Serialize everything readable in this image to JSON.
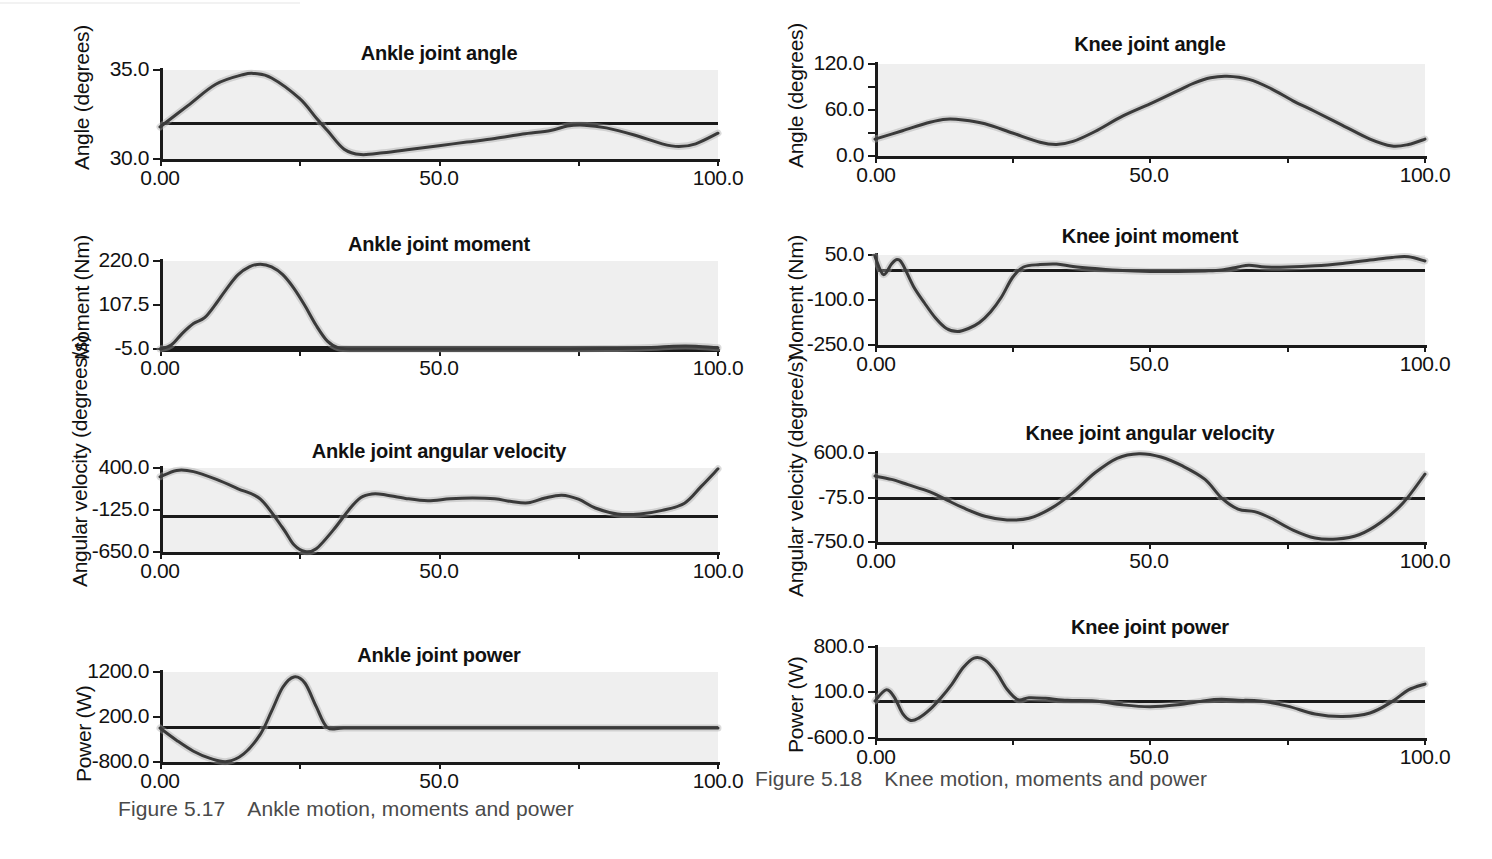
{
  "figures": [
    {
      "id": "ankle",
      "caption_number": "Figure 5.17",
      "caption_text": "Ankle motion, moments and power",
      "panels": [
        {
          "title": "Ankle joint angle",
          "ylabel": "Angle (degrees)",
          "yticks": [
            "35.0",
            "30.0"
          ],
          "xticks": [
            "0.00",
            "50.0",
            "100.0"
          ]
        },
        {
          "title": "Ankle joint moment",
          "ylabel": "Moment (Nm)",
          "yticks": [
            "220.0",
            "107.5",
            "-5.0"
          ],
          "xticks": [
            "0.00",
            "50.0",
            "100.0"
          ]
        },
        {
          "title": "Ankle joint angular velocity",
          "ylabel": "Angular velocity (degrees/s)",
          "yticks": [
            "400.0",
            "-125.0",
            "-650.0"
          ],
          "xticks": [
            "0.00",
            "50.0",
            "100.0"
          ]
        },
        {
          "title": "Ankle joint power",
          "ylabel": "Power (W)",
          "yticks": [
            "1200.0",
            "200.0",
            "-800.0"
          ],
          "xticks": [
            "0.00",
            "50.0",
            "100.0"
          ]
        }
      ]
    },
    {
      "id": "knee",
      "caption_number": "Figure 5.18",
      "caption_text": "Knee motion, moments and power",
      "panels": [
        {
          "title": "Knee joint angle",
          "ylabel": "Angle (degrees)",
          "yticks": [
            "120.0",
            "60.0",
            "0.0"
          ],
          "xticks": [
            "0.00",
            "50.0",
            "100.0"
          ]
        },
        {
          "title": "Knee joint moment",
          "ylabel": "Moment (Nm)",
          "yticks": [
            "50.0",
            "-100.0",
            "-250.0"
          ],
          "xticks": [
            "0.00",
            "50.0",
            "100.0"
          ]
        },
        {
          "title": "Knee  joint angular velocity",
          "ylabel": "Angular velocity (degree/s)",
          "yticks": [
            "600.0",
            "-75.0",
            "-750.0"
          ],
          "xticks": [
            "0.00",
            "50.0",
            "100.0"
          ]
        },
        {
          "title": "Knee joint power",
          "ylabel": "Power (W)",
          "yticks": [
            "800.0",
            "100.0",
            "-600.0"
          ],
          "xticks": [
            "0.00",
            "50.0",
            "100.0"
          ]
        }
      ]
    }
  ],
  "chart_data": [
    {
      "type": "line",
      "title": "Ankle joint angle",
      "xlabel": "",
      "ylabel": "Angle (degrees)",
      "xlim": [
        0,
        100
      ],
      "ylim": [
        30.0,
        35.0
      ],
      "yticks": [
        30.0,
        35.0
      ],
      "xticks": [
        0.0,
        50.0,
        100.0
      ],
      "grid": false,
      "legend": "none",
      "band": "mean +/- SD shaded",
      "reference_line_y": 31.8,
      "x": [
        0,
        5,
        10,
        15,
        17,
        20,
        25,
        28,
        30,
        33,
        36,
        40,
        45,
        50,
        55,
        60,
        65,
        70,
        73,
        76,
        80,
        85,
        90,
        93,
        96,
        100
      ],
      "values": [
        31.8,
        33.0,
        34.2,
        34.75,
        34.8,
        34.55,
        33.4,
        32.3,
        31.6,
        30.55,
        30.25,
        30.35,
        30.55,
        30.75,
        30.95,
        31.15,
        31.4,
        31.6,
        31.85,
        31.9,
        31.75,
        31.35,
        30.85,
        30.7,
        30.85,
        31.45
      ]
    },
    {
      "type": "line",
      "title": "Ankle joint moment",
      "xlabel": "",
      "ylabel": "Moment (Nm)",
      "xlim": [
        0,
        100
      ],
      "ylim": [
        -5.0,
        220.0
      ],
      "yticks": [
        -5.0,
        107.5,
        220.0
      ],
      "xticks": [
        0.0,
        50.0,
        100.0
      ],
      "grid": false,
      "legend": "none",
      "band": "mean +/- SD shaded",
      "reference_line_y": 0.0,
      "x": [
        0,
        2,
        4,
        6,
        8,
        10,
        12,
        14,
        16,
        18,
        20,
        22,
        24,
        26,
        28,
        30,
        32,
        35,
        40,
        50,
        60,
        70,
        80,
        88,
        92,
        96,
        100
      ],
      "values": [
        -5,
        5,
        35,
        60,
        75,
        110,
        150,
        185,
        205,
        212,
        205,
        185,
        150,
        105,
        55,
        15,
        -2,
        -5,
        -5,
        -5,
        -5,
        -5,
        -4,
        -1,
        2,
        2,
        -2
      ]
    },
    {
      "type": "line",
      "title": "Ankle joint angular velocity",
      "xlabel": "",
      "ylabel": "Angular velocity (degrees/s)",
      "xlim": [
        0,
        100
      ],
      "ylim": [
        -650.0,
        400.0
      ],
      "yticks": [
        -650.0,
        -125.0,
        400.0
      ],
      "xticks": [
        0.0,
        50.0,
        100.0
      ],
      "grid": false,
      "legend": "none",
      "band": "mean +/- SD shaded",
      "reference_line_y": -55.0,
      "x": [
        0,
        3,
        6,
        10,
        14,
        18,
        22,
        24,
        26,
        28,
        31,
        34,
        36,
        38,
        40,
        44,
        48,
        52,
        56,
        60,
        63,
        66,
        69,
        72,
        75,
        78,
        82,
        86,
        90,
        94,
        97,
        100
      ],
      "values": [
        290,
        370,
        355,
        260,
        140,
        10,
        -350,
        -560,
        -645,
        -610,
        -380,
        -110,
        30,
        75,
        70,
        20,
        -10,
        15,
        25,
        15,
        -20,
        -35,
        25,
        60,
        10,
        -100,
        -175,
        -175,
        -130,
        -40,
        170,
        390
      ]
    },
    {
      "type": "line",
      "title": "Ankle joint power",
      "xlabel": "",
      "ylabel": "Power (W)",
      "xlim": [
        0,
        100
      ],
      "ylim": [
        -800.0,
        1200.0
      ],
      "yticks": [
        -800.0,
        200.0,
        1200.0
      ],
      "xticks": [
        0.0,
        50.0,
        100.0
      ],
      "grid": false,
      "legend": "none",
      "band": "mean +/- SD shaded",
      "reference_line_y": -40.0,
      "x": [
        0,
        3,
        6,
        9,
        12,
        15,
        18,
        20,
        22,
        24,
        26,
        28,
        30,
        33,
        40,
        50,
        60,
        70,
        80,
        90,
        100
      ],
      "values": [
        -45,
        -320,
        -560,
        -720,
        -790,
        -620,
        -180,
        330,
        860,
        1090,
        950,
        430,
        -35,
        -45,
        -45,
        -45,
        -45,
        -45,
        -45,
        -45,
        -45
      ]
    },
    {
      "type": "line",
      "title": "Knee joint angle",
      "xlabel": "",
      "ylabel": "Angle (degrees)",
      "xlim": [
        0,
        100
      ],
      "ylim": [
        0.0,
        120.0
      ],
      "yticks": [
        0.0,
        60.0,
        120.0
      ],
      "xticks": [
        0.0,
        50.0,
        100.0
      ],
      "grid": false,
      "legend": "none",
      "band": "mean +/- SD shaded",
      "reference_line_y": 0.0,
      "x": [
        0,
        5,
        10,
        13,
        16,
        20,
        25,
        30,
        33,
        36,
        40,
        45,
        50,
        55,
        58,
        61,
        64,
        68,
        72,
        76,
        80,
        85,
        90,
        94,
        97,
        100
      ],
      "values": [
        22,
        33,
        44,
        48,
        47,
        42,
        30,
        18,
        15,
        19,
        32,
        52,
        68,
        85,
        95,
        102,
        104,
        100,
        88,
        72,
        58,
        40,
        22,
        13,
        15,
        22
      ]
    },
    {
      "type": "line",
      "title": "Knee joint moment",
      "xlabel": "",
      "ylabel": "Moment (Nm)",
      "xlim": [
        0,
        100
      ],
      "ylim": [
        -250.0,
        50.0
      ],
      "yticks": [
        -250.0,
        -100.0,
        50.0
      ],
      "xticks": [
        0.0,
        50.0,
        100.0
      ],
      "grid": false,
      "legend": "none",
      "band": "mean +/- SD shaded",
      "reference_line_y": 0.0,
      "x": [
        0,
        1.5,
        3,
        4,
        5,
        7,
        9,
        11,
        13,
        15,
        17,
        19,
        21,
        23,
        25,
        27,
        30,
        33,
        36,
        40,
        45,
        50,
        55,
        60,
        63,
        66,
        68,
        71,
        75,
        80,
        85,
        90,
        94,
        97,
        100
      ],
      "values": [
        45,
        -15,
        20,
        35,
        20,
        -55,
        -110,
        -160,
        -195,
        -205,
        -195,
        -175,
        -140,
        -90,
        -25,
        10,
        18,
        20,
        12,
        5,
        -2,
        -5,
        -5,
        -3,
        0,
        10,
        16,
        10,
        10,
        14,
        22,
        33,
        42,
        44,
        30
      ]
    },
    {
      "type": "line",
      "title": "Knee  joint angular velocity",
      "xlabel": "",
      "ylabel": "Angular velocity (degree/s)",
      "xlim": [
        0,
        100
      ],
      "ylim": [
        -750.0,
        600.0
      ],
      "yticks": [
        -750.0,
        -75.0,
        600.0
      ],
      "xticks": [
        0.0,
        50.0,
        100.0
      ],
      "grid": false,
      "legend": "none",
      "band": "mean +/- SD shaded",
      "reference_line_y": -110.0,
      "x": [
        0,
        3,
        6,
        10,
        13,
        16,
        20,
        24,
        28,
        32,
        36,
        40,
        44,
        48,
        52,
        56,
        60,
        63,
        66,
        69,
        72,
        76,
        80,
        84,
        88,
        92,
        96,
        100
      ],
      "values": [
        250,
        200,
        120,
        10,
        -110,
        -230,
        -360,
        -415,
        -390,
        -240,
        0,
        300,
        520,
        590,
        540,
        400,
        200,
        -80,
        -250,
        -290,
        -390,
        -570,
        -690,
        -705,
        -640,
        -450,
        -160,
        280
      ]
    },
    {
      "type": "line",
      "title": "Knee joint power",
      "xlabel": "",
      "ylabel": "Power (W)",
      "xlim": [
        0,
        100
      ],
      "ylim": [
        -600.0,
        800.0
      ],
      "yticks": [
        -600.0,
        100.0,
        800.0
      ],
      "xticks": [
        0.0,
        50.0,
        100.0
      ],
      "grid": false,
      "legend": "none",
      "band": "mean +/- SD shaded",
      "reference_line_y": -20.0,
      "x": [
        0,
        2,
        3.5,
        5,
        6.5,
        8,
        10,
        12,
        14,
        16,
        18,
        20,
        22,
        24,
        26,
        28,
        31,
        35,
        40,
        45,
        50,
        55,
        60,
        63,
        66,
        70,
        75,
        80,
        85,
        90,
        94,
        97,
        100
      ],
      "values": [
        -30,
        140,
        30,
        -220,
        -330,
        -290,
        -160,
        20,
        230,
        480,
        630,
        600,
        420,
        150,
        -10,
        20,
        10,
        -20,
        -30,
        -90,
        -120,
        -90,
        -25,
        -5,
        -20,
        -30,
        -110,
        -230,
        -270,
        -215,
        -40,
        140,
        230
      ]
    }
  ]
}
